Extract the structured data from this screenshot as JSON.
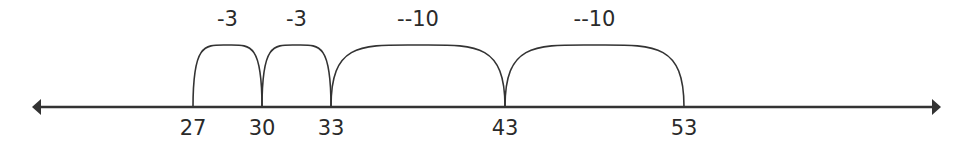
{
  "diagram": {
    "type": "number-line-jumps",
    "line": {
      "x1": 32,
      "x2": 941,
      "y": 107,
      "color": "#333333"
    },
    "ticks": [
      {
        "value": "27",
        "x": 193
      },
      {
        "value": "30",
        "x": 262
      },
      {
        "value": "33",
        "x": 331
      },
      {
        "value": "43",
        "x": 505
      },
      {
        "value": "53",
        "x": 684
      }
    ],
    "jumps": [
      {
        "from": "27",
        "to": "30",
        "label": "-3",
        "x1": 193,
        "x2": 262,
        "peak_y": 45
      },
      {
        "from": "30",
        "to": "33",
        "label": "-3",
        "x1": 262,
        "x2": 331,
        "peak_y": 45
      },
      {
        "from": "33",
        "to": "43",
        "label": "--10",
        "x1": 331,
        "x2": 505,
        "peak_y": 45
      },
      {
        "from": "43",
        "to": "53",
        "label": "--10",
        "x1": 505,
        "x2": 684,
        "peak_y": 45
      }
    ]
  }
}
